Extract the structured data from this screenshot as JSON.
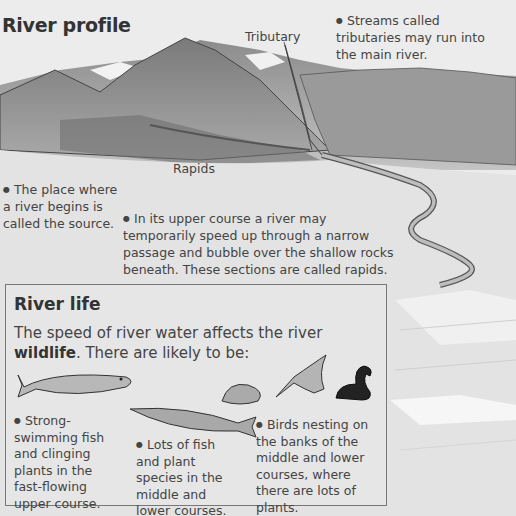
{
  "profile": {
    "title": "River profile",
    "labels": {
      "tributary": "Tributary",
      "rapids": "Rapids"
    },
    "notes": {
      "streams": "Streams called tributaries may run into the main river.",
      "source": "The place where a river begins is called the source.",
      "upper_course": "In its upper course a river may temporarily speed up through a narrow passage and bubble over the shallow rocks beneath. These sections are called rapids."
    }
  },
  "river_life": {
    "title": "River life",
    "intro_text": "The speed of river water affects the river ",
    "intro_bold": "wildlife",
    "intro_end": ". There are likely to be:",
    "items": [
      {
        "text": "Strong-swimming fish and clinging plants in the fast-flowing upper course."
      },
      {
        "text": "Lots of fish and plant species in the middle and lower courses."
      },
      {
        "text": "Birds nesting on the banks of the middle and lower courses, where there are lots of plants."
      }
    ],
    "illustrations": [
      "trout-fish",
      "pike-fish",
      "small-fish",
      "kingfisher-bird",
      "coot-bird"
    ]
  }
}
